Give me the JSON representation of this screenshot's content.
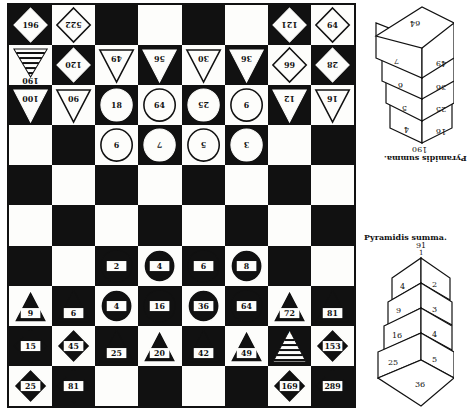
{
  "board": {
    "cols": 8,
    "rows": 10,
    "first_cell": "dark",
    "pieces": [
      {
        "row": 0,
        "col": 0,
        "shape": "diamond",
        "style": "white-on-dark",
        "label": "196",
        "inverted": false
      },
      {
        "row": 0,
        "col": 1,
        "shape": "diamond",
        "style": "outline",
        "label": "522",
        "inverted": true
      },
      {
        "row": 0,
        "col": 6,
        "shape": "diamond",
        "style": "white-on-dark",
        "label": "121",
        "inverted": true
      },
      {
        "row": 0,
        "col": 7,
        "shape": "diamond",
        "style": "outline",
        "label": "64",
        "inverted": false
      },
      {
        "row": 1,
        "col": 0,
        "shape": "pyramid",
        "style": "striped",
        "label": "190",
        "inverted": true
      },
      {
        "row": 1,
        "col": 1,
        "shape": "diamond",
        "style": "white-on-dark",
        "label": "120",
        "inverted": true
      },
      {
        "row": 1,
        "col": 2,
        "shape": "triangle-down",
        "style": "outline",
        "label": "49",
        "inverted": true
      },
      {
        "row": 1,
        "col": 3,
        "shape": "triangle-down",
        "style": "white-on-dark",
        "label": "56",
        "inverted": true
      },
      {
        "row": 1,
        "col": 4,
        "shape": "triangle-down",
        "style": "outline",
        "label": "30",
        "inverted": true
      },
      {
        "row": 1,
        "col": 5,
        "shape": "triangle-down",
        "style": "white-on-dark",
        "label": "36",
        "inverted": true
      },
      {
        "row": 1,
        "col": 6,
        "shape": "diamond",
        "style": "outline",
        "label": "66",
        "inverted": true
      },
      {
        "row": 1,
        "col": 7,
        "shape": "diamond",
        "style": "white-on-dark",
        "label": "28",
        "inverted": true
      },
      {
        "row": 2,
        "col": 0,
        "shape": "triangle-down",
        "style": "white-on-dark",
        "label": "100",
        "inverted": true
      },
      {
        "row": 2,
        "col": 1,
        "shape": "triangle-down",
        "style": "outline",
        "label": "90",
        "inverted": true
      },
      {
        "row": 2,
        "col": 2,
        "shape": "circle",
        "style": "white-on-dark",
        "label": "18",
        "inverted": false
      },
      {
        "row": 2,
        "col": 3,
        "shape": "circle",
        "style": "outline",
        "label": "64",
        "inverted": false
      },
      {
        "row": 2,
        "col": 4,
        "shape": "circle",
        "style": "white-on-dark",
        "label": "25",
        "inverted": true
      },
      {
        "row": 2,
        "col": 5,
        "shape": "circle",
        "style": "outline",
        "label": "6",
        "inverted": false
      },
      {
        "row": 2,
        "col": 6,
        "shape": "triangle-down",
        "style": "white-on-dark",
        "label": "12",
        "inverted": true
      },
      {
        "row": 2,
        "col": 7,
        "shape": "triangle-down",
        "style": "outline",
        "label": "16",
        "inverted": true
      },
      {
        "row": 3,
        "col": 2,
        "shape": "circle",
        "style": "outline",
        "label": "9",
        "inverted": true
      },
      {
        "row": 3,
        "col": 3,
        "shape": "circle",
        "style": "white-on-dark",
        "label": "7",
        "inverted": true
      },
      {
        "row": 3,
        "col": 4,
        "shape": "circle",
        "style": "outline",
        "label": "5",
        "inverted": true
      },
      {
        "row": 3,
        "col": 5,
        "shape": "circle",
        "style": "white-on-dark",
        "label": "3",
        "inverted": true
      },
      {
        "row": 6,
        "col": 2,
        "shape": "circle",
        "style": "black-on-light",
        "label": "2",
        "inverted": false
      },
      {
        "row": 6,
        "col": 3,
        "shape": "circle",
        "style": "ring-on-dark",
        "label": "4",
        "inverted": false
      },
      {
        "row": 6,
        "col": 4,
        "shape": "circle",
        "style": "black-on-light",
        "label": "6",
        "inverted": false
      },
      {
        "row": 6,
        "col": 5,
        "shape": "circle",
        "style": "ring-on-dark",
        "label": "8",
        "inverted": false
      },
      {
        "row": 7,
        "col": 0,
        "shape": "triangle-up",
        "style": "ring-on-dark",
        "label": "9",
        "inverted": false
      },
      {
        "row": 7,
        "col": 1,
        "shape": "triangle-up",
        "style": "black-on-light",
        "label": "6",
        "inverted": false
      },
      {
        "row": 7,
        "col": 2,
        "shape": "circle",
        "style": "ring-on-dark",
        "label": "4",
        "inverted": false
      },
      {
        "row": 7,
        "col": 3,
        "shape": "circle",
        "style": "black-on-light",
        "label": "16",
        "inverted": false
      },
      {
        "row": 7,
        "col": 4,
        "shape": "circle",
        "style": "ring-on-dark",
        "label": "36",
        "inverted": false
      },
      {
        "row": 7,
        "col": 5,
        "shape": "circle",
        "style": "black-on-light",
        "label": "64",
        "inverted": false
      },
      {
        "row": 7,
        "col": 6,
        "shape": "triangle-up",
        "style": "ring-on-dark",
        "label": "72",
        "inverted": false
      },
      {
        "row": 7,
        "col": 7,
        "shape": "triangle-up",
        "style": "black-on-light",
        "label": "81",
        "inverted": false
      },
      {
        "row": 8,
        "col": 0,
        "shape": "diamond",
        "style": "black-on-light",
        "label": "15",
        "inverted": false
      },
      {
        "row": 8,
        "col": 1,
        "shape": "diamond",
        "style": "ring-on-dark",
        "label": "45",
        "inverted": false
      },
      {
        "row": 8,
        "col": 2,
        "shape": "triangle-up",
        "style": "black-on-light",
        "label": "25",
        "inverted": false
      },
      {
        "row": 8,
        "col": 3,
        "shape": "triangle-up",
        "style": "ring-on-dark",
        "label": "20",
        "inverted": false
      },
      {
        "row": 8,
        "col": 4,
        "shape": "triangle-up",
        "style": "black-on-light",
        "label": "42",
        "inverted": false
      },
      {
        "row": 8,
        "col": 5,
        "shape": "triangle-up",
        "style": "ring-on-dark",
        "label": "49",
        "inverted": false
      },
      {
        "row": 8,
        "col": 6,
        "shape": "pyramid",
        "style": "striped-up",
        "label": "91",
        "inverted": false
      },
      {
        "row": 8,
        "col": 7,
        "shape": "diamond",
        "style": "ring-on-dark",
        "label": "153",
        "inverted": false
      },
      {
        "row": 9,
        "col": 0,
        "shape": "diamond",
        "style": "ring-on-dark",
        "label": "25",
        "inverted": false
      },
      {
        "row": 9,
        "col": 1,
        "shape": "diamond",
        "style": "black-on-light",
        "label": "81",
        "inverted": false
      },
      {
        "row": 9,
        "col": 6,
        "shape": "diamond",
        "style": "ring-on-dark",
        "label": "169",
        "inverted": false
      },
      {
        "row": 9,
        "col": 7,
        "shape": "diamond",
        "style": "black-on-light",
        "label": "289",
        "inverted": false
      }
    ]
  },
  "pyramid_top": {
    "caption": "Pyramidis summa.",
    "sum": "190",
    "inverted": true,
    "top_face": "64",
    "left_faces": [
      "7",
      "6",
      "5",
      "4"
    ],
    "right_faces": [
      "49",
      "36",
      "25",
      "16"
    ]
  },
  "pyramid_bottom": {
    "caption": "Pyramidis summa.",
    "sum": "91",
    "apex": "1",
    "left_faces": [
      "4",
      "9",
      "16",
      "25"
    ],
    "right_faces": [
      "2",
      "3",
      "4",
      "5"
    ],
    "bottom_face": "36"
  },
  "colors": {
    "ink": "#111111",
    "paper": "#fdfdfb"
  }
}
